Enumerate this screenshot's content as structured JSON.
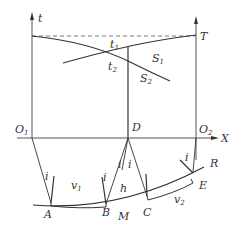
{
  "diagram": {
    "type": "seismic reflection time-distance diagram",
    "colors": {
      "line": "#333333",
      "axis": "#555555",
      "background": "#ffffff"
    },
    "axes": {
      "t_label": "t",
      "x_label": "X",
      "T_label": "T"
    },
    "points": {
      "O1": {
        "main": "O",
        "sub": "1"
      },
      "O2": {
        "main": "O",
        "sub": "2"
      },
      "D": "D",
      "A": "A",
      "B": "B",
      "M": "M",
      "C": "C",
      "E": "E",
      "R": "R"
    },
    "curves": {
      "S1": {
        "main": "S",
        "sub": "1"
      },
      "S2": {
        "main": "S",
        "sub": "2"
      }
    },
    "times": {
      "t1": {
        "main": "t",
        "sub": "1"
      },
      "t2": {
        "main": "t",
        "sub": "2"
      }
    },
    "velocities": {
      "v1": {
        "main": "v",
        "sub": "1"
      },
      "v2": {
        "main": "v",
        "sub": "2"
      }
    },
    "angle_label": "i",
    "depth_label": "h"
  }
}
